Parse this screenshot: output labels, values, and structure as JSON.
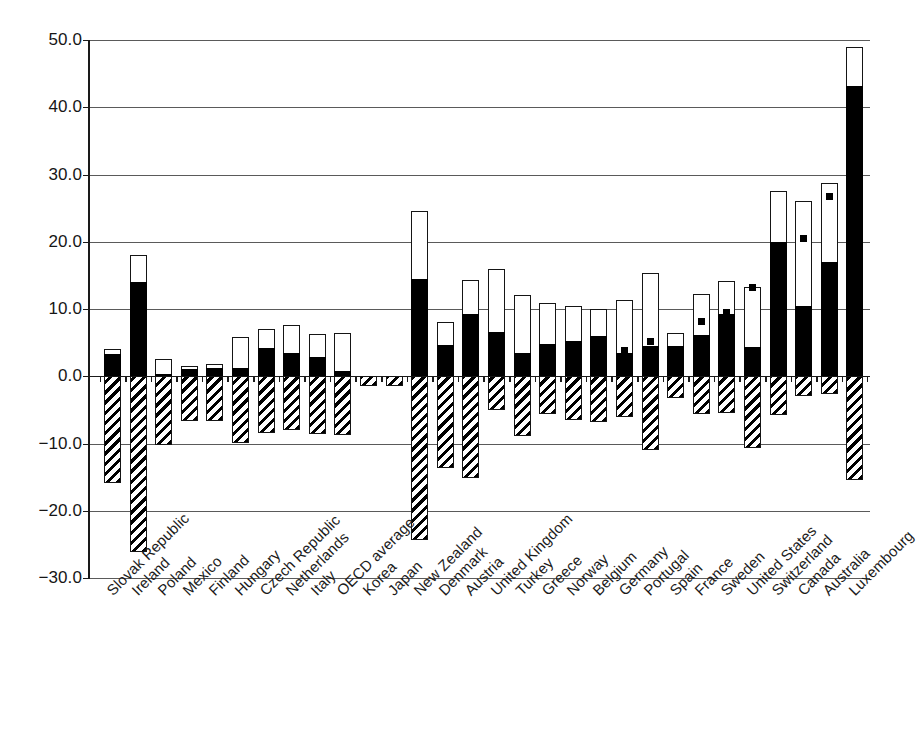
{
  "chart_data": {
    "type": "bar",
    "title": "",
    "subtitle": "",
    "xlabel": "",
    "ylabel": "",
    "ylim": [
      -30.0,
      50.0
    ],
    "grid": true,
    "legend_position": "none",
    "stacked": true,
    "y_ticks": [
      50.0,
      40.0,
      30.0,
      20.0,
      10.0,
      0.0,
      -10.0,
      -20.0,
      -30.0
    ],
    "y_tick_labels": [
      "50.0",
      "40.0",
      "30.0",
      "20.0",
      "10.0",
      "0.0",
      "-10.0",
      "-20.0",
      "-30.0"
    ],
    "categories": [
      "Slovak Republic",
      "Ireland",
      "Poland",
      "Mexico",
      "Finland",
      "Hungary",
      "Czech Republic",
      "Netherlands",
      "Italy",
      "OECD average",
      "Korea",
      "Japan",
      "New Zealand",
      "Denmark",
      "Austria",
      "United Kingdom",
      "Turkey",
      "Greece",
      "Norway",
      "Belgium",
      "Germany",
      "Portugal",
      "Spain",
      "France",
      "Sweden",
      "United States",
      "Switzerland",
      "Canada",
      "Australia",
      "Luxembourg"
    ],
    "series": [
      {
        "name": "black-positive-segment",
        "style": "solid-black",
        "values": [
          3.3,
          14.0,
          0.4,
          1.1,
          1.2,
          1.3,
          4.2,
          3.5,
          2.9,
          0.8,
          -1.0,
          -1.2,
          14.5,
          4.6,
          9.3,
          6.6,
          3.5,
          4.8,
          5.2,
          6.0,
          3.4,
          4.5,
          4.5,
          6.2,
          9.3,
          4.3,
          20.0,
          10.5,
          17.0,
          43.1
        ]
      },
      {
        "name": "white-upper-segment-top",
        "style": "outline-white",
        "values": [
          4.1,
          18.0,
          2.6,
          1.5,
          1.8,
          5.9,
          7.0,
          7.6,
          6.3,
          6.4,
          -0.3,
          -0.4,
          24.5,
          8.1,
          14.3,
          16.0,
          12.1,
          10.9,
          10.4,
          10.0,
          11.3,
          15.3,
          6.5,
          12.2,
          14.1,
          13.2,
          27.5,
          26.1,
          28.8,
          49.0
        ]
      },
      {
        "name": "hatched-negative-segment",
        "style": "diagonal-hatch",
        "values": [
          -15.8,
          -26.1,
          -10.2,
          -6.7,
          -6.7,
          -9.9,
          -8.4,
          -8.0,
          -8.6,
          -8.7,
          -1.4,
          -1.5,
          -24.3,
          -13.6,
          -15.2,
          -5.0,
          -8.9,
          -5.6,
          -6.5,
          -6.8,
          -6.1,
          -10.9,
          -3.3,
          -5.6,
          -5.5,
          -10.6,
          -5.7,
          -3.0,
          -2.6,
          -15.5
        ]
      },
      {
        "name": "point-marker",
        "style": "square-marker",
        "values": [
          null,
          null,
          null,
          null,
          null,
          null,
          null,
          null,
          null,
          null,
          null,
          null,
          null,
          null,
          null,
          null,
          null,
          null,
          null,
          null,
          3.9,
          5.2,
          null,
          8.1,
          9.5,
          13.2,
          null,
          20.5,
          26.8,
          null
        ]
      }
    ]
  },
  "axis": {
    "y_unit": "",
    "x_rotation_deg": -45
  },
  "colors": {
    "black": "#000000",
    "outline": "#151515",
    "grid": "#5a5a5a",
    "background": "#ffffff",
    "text": "#1b1b1b"
  }
}
